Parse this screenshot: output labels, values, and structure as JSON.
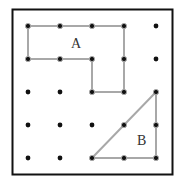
{
  "diagram": {
    "grid": {
      "rows": 5,
      "cols": 5
    },
    "colors": {
      "border": "#111111",
      "peg": "#111111",
      "band": "#a8a8a8",
      "label": "#333333"
    },
    "shapes": [
      {
        "id": "A",
        "label": "A",
        "vertices": [
          [
            0,
            0
          ],
          [
            3,
            0
          ],
          [
            3,
            2
          ],
          [
            2,
            2
          ],
          [
            2,
            1
          ],
          [
            0,
            1
          ]
        ],
        "label_pos": [
          1.5,
          0.5
        ]
      },
      {
        "id": "B",
        "label": "B",
        "vertices": [
          [
            2,
            4
          ],
          [
            4,
            2
          ],
          [
            4,
            4
          ]
        ],
        "label_pos": [
          3.55,
          3.45
        ]
      }
    ]
  }
}
